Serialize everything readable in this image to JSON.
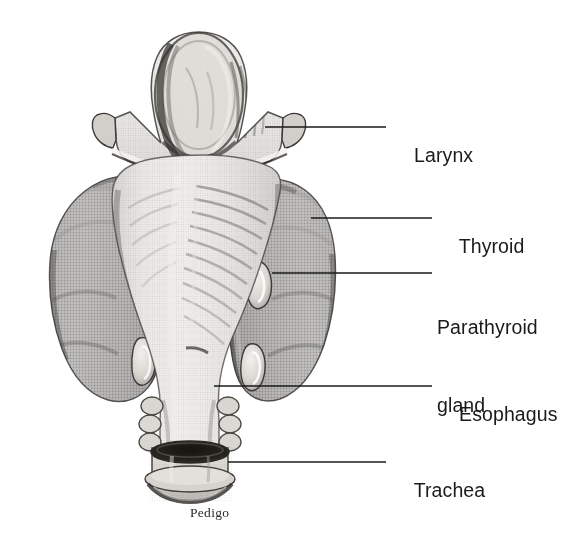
{
  "figure": {
    "background_color": "#ffffff",
    "ink_color": "#1a1a1a",
    "signature": "Pedigo"
  },
  "labels": [
    {
      "id": "larynx",
      "text": "Larynx",
      "lines": [
        "Larynx"
      ],
      "text_x": 392,
      "text_y": 116,
      "leader": {
        "x1": 265,
        "y1": 127,
        "x2": 386,
        "y2": 127
      }
    },
    {
      "id": "thyroid",
      "text": "Thyroid",
      "lines": [
        "Thyroid"
      ],
      "text_x": 437,
      "text_y": 207,
      "leader": {
        "x1": 311,
        "y1": 218,
        "x2": 432,
        "y2": 218
      }
    },
    {
      "id": "parathyroid-gland",
      "text": "Parathyroid gland",
      "lines": [
        "Parathyroid",
        "gland"
      ],
      "text_x": 437,
      "text_y": 262,
      "leader": {
        "x1": 272,
        "y1": 273,
        "x2": 432,
        "y2": 273
      }
    },
    {
      "id": "esophagus",
      "text": "Esophagus",
      "lines": [
        "Esophagus"
      ],
      "text_x": 437,
      "text_y": 375,
      "leader": {
        "x1": 214,
        "y1": 386,
        "x2": 432,
        "y2": 386
      }
    },
    {
      "id": "trachea",
      "text": "Trachea",
      "lines": [
        "Trachea"
      ],
      "text_x": 392,
      "text_y": 451,
      "leader": {
        "x1": 228,
        "y1": 462,
        "x2": 386,
        "y2": 462
      }
    }
  ],
  "anatomy": {
    "structures": [
      {
        "id": "epiglottis",
        "name": "Epiglottis",
        "shade": "#c9c6c2"
      },
      {
        "id": "thyroid-cartilage",
        "name": "Thyroid cartilage",
        "shade": "#d2cfca"
      },
      {
        "id": "superior-horn-left",
        "name": "Left superior horn",
        "shade": "#cbc8c3"
      },
      {
        "id": "superior-horn-right",
        "name": "Right superior horn",
        "shade": "#cbc8c3"
      },
      {
        "id": "thyroid-lobe-left",
        "name": "Left lobe of thyroid gland",
        "shade": "#6e6c69"
      },
      {
        "id": "thyroid-lobe-right",
        "name": "Right lobe of thyroid gland",
        "shade": "#6e6c69"
      },
      {
        "id": "parathyroid-superior-left",
        "name": "Superior left parathyroid gland",
        "shade": "#e8e6e1"
      },
      {
        "id": "parathyroid-inferior-left",
        "name": "Inferior left parathyroid gland",
        "shade": "#e8e6e1"
      },
      {
        "id": "parathyroid-superior-right",
        "name": "Superior right parathyroid gland",
        "shade": "#e8e6e1"
      },
      {
        "id": "parathyroid-inferior-right",
        "name": "Inferior right parathyroid gland",
        "shade": "#e8e6e1"
      },
      {
        "id": "esophagus-body",
        "name": "Esophagus",
        "shade": "#cdcac5"
      },
      {
        "id": "trachea-body",
        "name": "Trachea",
        "shade": "#d4d1cc"
      },
      {
        "id": "trachea-lumen",
        "name": "Tracheal lumen (cut end)",
        "shade": "#2e2c2a"
      }
    ]
  }
}
